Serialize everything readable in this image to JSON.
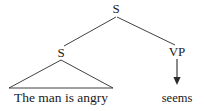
{
  "diagram": {
    "type": "syntax-tree",
    "background_color": "#ffffff",
    "line_color": "#2b2b2b",
    "text_color": "#1a1a1a",
    "root": {
      "label": "S"
    },
    "left_branch": {
      "label": "S",
      "terminal": "The man is angry",
      "triangle": true
    },
    "right_branch": {
      "label": "VP",
      "terminal": "seems",
      "arrow": "down-arrow"
    }
  }
}
